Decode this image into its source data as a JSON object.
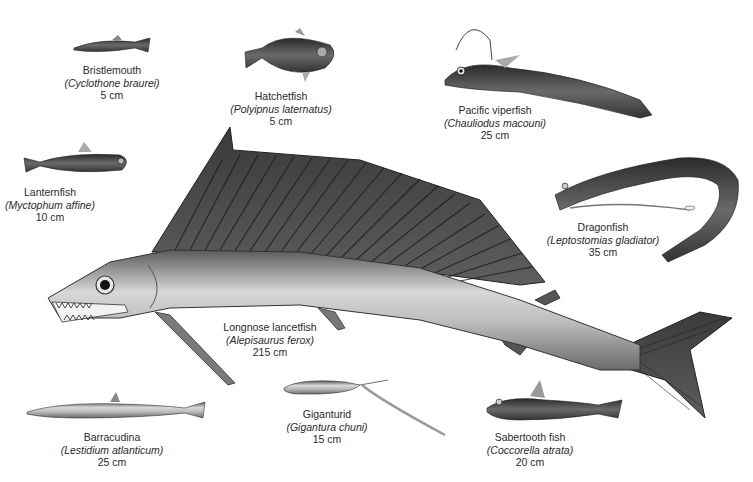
{
  "figure": {
    "background": "#ffffff",
    "ink_color": "#2a2a2a",
    "fish": [
      {
        "id": "bristlemouth",
        "common_name": "Bristlemouth",
        "scientific_name": "(Cyclothone braurei)",
        "size": "5 cm",
        "label_x": 112,
        "label_y": 64
      },
      {
        "id": "hatchetfish",
        "common_name": "Hatchetfish",
        "scientific_name": "(Polyipnus laternatus)",
        "size": "5 cm",
        "label_x": 281,
        "label_y": 90
      },
      {
        "id": "pacific-viperfish",
        "common_name": "Pacific viperfish",
        "scientific_name": "(Chauliodus macouni)",
        "size": "25 cm",
        "label_x": 495,
        "label_y": 104
      },
      {
        "id": "lanternfish",
        "common_name": "Lanternfish",
        "scientific_name": "(Myctophum affine)",
        "size": "10 cm",
        "label_x": 50,
        "label_y": 186
      },
      {
        "id": "dragonfish",
        "common_name": "Dragonfish",
        "scientific_name": "(Leptostomias gladiator)",
        "size": "35 cm",
        "label_x": 603,
        "label_y": 221
      },
      {
        "id": "longnose-lancetfish",
        "common_name": "Longnose lancetfish",
        "scientific_name": "(Alepisaurus ferox)",
        "size": "215 cm",
        "label_x": 270,
        "label_y": 321
      },
      {
        "id": "barracudina",
        "common_name": "Barracudina",
        "scientific_name": "(Lestidium atlanticum)",
        "size": "25 cm",
        "label_x": 112,
        "label_y": 431
      },
      {
        "id": "giganturid",
        "common_name": "Giganturid",
        "scientific_name": "(Gigantura chuni)",
        "size": "15 cm",
        "label_x": 327,
        "label_y": 408
      },
      {
        "id": "sabertooth-fish",
        "common_name": "Sabertooth fish",
        "scientific_name": "(Coccorella atrata)",
        "size": "20 cm",
        "label_x": 530,
        "label_y": 431
      }
    ]
  }
}
